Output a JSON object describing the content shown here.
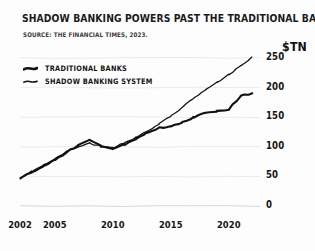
{
  "header": {
    "title": "SHADOW BANKING POWERS PAST THE TRADITIONAL BANKING SYSTEM",
    "source": "SOURCE: THE FINANCIAL TIMES, 2023."
  },
  "legend": {
    "items": [
      {
        "label": "TRADITIONAL BANKS",
        "color": "#111111",
        "width": 2.6
      },
      {
        "label": "SHADOW BANKING SYSTEM",
        "color": "#111111",
        "width": 1.5
      }
    ]
  },
  "colors": {
    "ink": "#111111",
    "grid": "#e9e9e9",
    "background": "#fdfdfd"
  },
  "chart_data": {
    "type": "line",
    "title": "SHADOW BANKING POWERS PAST THE TRADITIONAL BANKING SYSTEM",
    "subtitle": "SOURCE: THE FINANCIAL TIMES, 2023.",
    "xlabel": "",
    "ylabel": "$TN",
    "yunit": "$TN",
    "xlim": [
      2002,
      2022
    ],
    "ylim": [
      0,
      260
    ],
    "ytick_labels": [
      "0",
      "50",
      "100",
      "150",
      "200",
      "250"
    ],
    "yticks": [
      0,
      50,
      100,
      150,
      200,
      250
    ],
    "xtick_labels": [
      "2002",
      "2005",
      "2010",
      "2015",
      "2020"
    ],
    "xticks": [
      2002,
      2005,
      2010,
      2015,
      2020
    ],
    "grid": true,
    "grid_axis": "y",
    "legend_position": "top-left",
    "x": [
      2002,
      2003,
      2004,
      2005,
      2006,
      2007,
      2008,
      2009,
      2010,
      2011,
      2012,
      2013,
      2014,
      2015,
      2016,
      2017,
      2018,
      2019,
      2020,
      2021,
      2022
    ],
    "series": [
      {
        "name": "TRADITIONAL BANKS",
        "values": [
          47,
          57,
          67,
          78,
          90,
          103,
          112,
          101,
          96,
          104,
          113,
          124,
          132,
          134,
          141,
          150,
          158,
          160,
          163,
          186,
          190
        ]
      },
      {
        "name": "SHADOW BANKING SYSTEM",
        "values": [
          47,
          58,
          69,
          80,
          92,
          100,
          106,
          100,
          98,
          107,
          116,
          126,
          138,
          152,
          167,
          182,
          196,
          209,
          222,
          236,
          252
        ]
      }
    ]
  }
}
